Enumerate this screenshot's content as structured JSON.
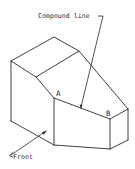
{
  "diagram": {
    "type": "isometric technical drawing",
    "labels": {
      "callout": "Compound line",
      "vertex_a": "A",
      "vertex_b": "B",
      "view_direction": "Front"
    },
    "colors": {
      "line": "#2a2a2a",
      "background": "#ffffff"
    }
  }
}
